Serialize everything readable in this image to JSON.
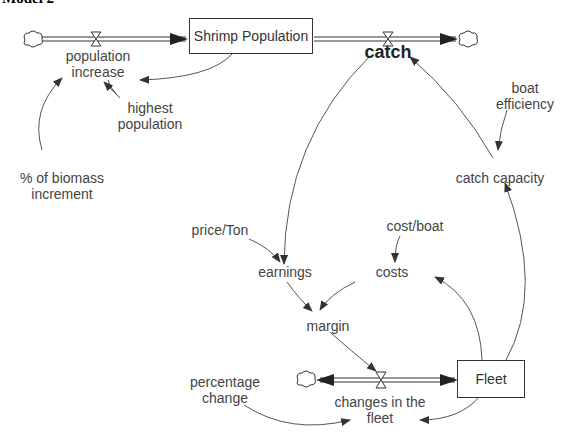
{
  "title": "Model 2",
  "stocks": {
    "shrimp_population": "Shrimp Population",
    "fleet": "Fleet"
  },
  "flows": {
    "population_increase": [
      "population",
      "increase"
    ],
    "catch": "catch",
    "changes_in_fleet": [
      "changes in the",
      "fleet"
    ]
  },
  "variables": {
    "highest_population": [
      "highest",
      "population"
    ],
    "biomass_increment": [
      "% of biomass",
      "increment"
    ],
    "boat_efficiency": [
      "boat",
      "efficiency"
    ],
    "catch_capacity": "catch capacity",
    "price_ton": "price/Ton",
    "earnings": "earnings",
    "cost_boat": "cost/boat",
    "costs": "costs",
    "margin": "margin",
    "percentage_change": [
      "percentage",
      "change"
    ]
  },
  "colors": {
    "line": "#333333",
    "text": "#444444"
  }
}
